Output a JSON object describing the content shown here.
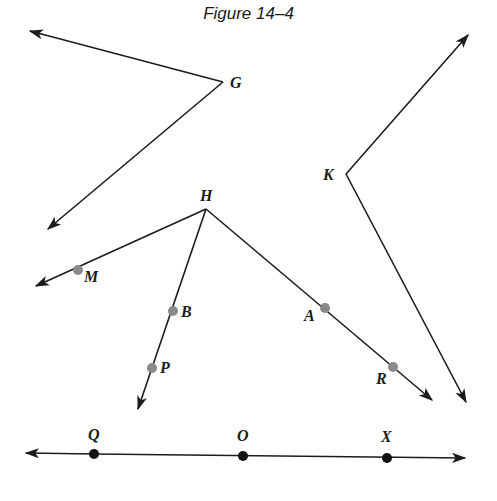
{
  "title": "Figure 14–4",
  "labels": {
    "G": "G",
    "K": "K",
    "H": "H",
    "M": "M",
    "B": "B",
    "P": "P",
    "A": "A",
    "R": "R",
    "Q": "Q",
    "O": "O",
    "X": "X"
  },
  "angles": [
    {
      "vertex": "G",
      "vertex_xy": [
        223,
        82
      ],
      "ray_ends": [
        [
          30,
          31
        ],
        [
          48,
          229
        ]
      ]
    },
    {
      "vertex": "K",
      "vertex_xy": [
        346,
        174
      ],
      "ray_ends": [
        [
          468,
          35
        ],
        [
          466,
          402
        ]
      ]
    },
    {
      "vertex": "H",
      "vertex_xy": [
        206,
        209
      ],
      "ray_ends": [
        [
          36,
          286
        ],
        [
          138,
          409
        ],
        [
          432,
          400
        ]
      ],
      "points_on_rays": {
        "HM": [
          "M"
        ],
        "HP": [
          "B",
          "P"
        ],
        "HR": [
          "A",
          "R"
        ]
      }
    }
  ],
  "line": {
    "points": [
      "Q",
      "O",
      "X"
    ],
    "arrows": "both"
  },
  "colors": {
    "ink": "#1c1c1c",
    "gray_point": "#8a8a8a",
    "black_point": "#111111"
  }
}
